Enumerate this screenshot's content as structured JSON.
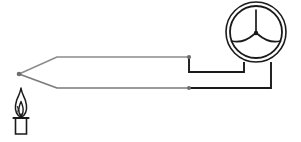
{
  "figure": {
    "type": "schematic-diagram",
    "width": 301,
    "height": 142,
    "background_color": "#ffffff"
  },
  "colors": {
    "wire_stroke": "#8c8c8c",
    "wire_stroke_dark": "#7a7a7a",
    "lead_stroke": "#1a1a1a",
    "meter_stroke": "#1a1a1a",
    "junction_dot": "#6e6e6e",
    "candle_outline": "#1a1a1a",
    "candle_body_fill": "#ffffff",
    "flame_fill": "#ffffff"
  },
  "components": [
    {
      "name": "candle",
      "label": "candle",
      "description": "lit candle providing heat to the hot junction",
      "x": 21,
      "y": 115
    },
    {
      "name": "flame",
      "label": "flame",
      "description": "candle flame heating the thermocouple junction",
      "x": 21,
      "y": 99
    },
    {
      "name": "hot-junction",
      "label": "hot junction",
      "description": "point where the two dissimilar wires are joined",
      "x": 19,
      "y": 74
    },
    {
      "name": "upper-wire",
      "label": "upper conductor",
      "description": "first thermocouple wire from junction to meter terminal"
    },
    {
      "name": "lower-wire",
      "label": "lower conductor",
      "description": "second thermocouple wire from junction to meter terminal"
    },
    {
      "name": "meter",
      "label": "galvanometer",
      "description": "analog needle meter indicating the thermoelectric voltage",
      "x": 256,
      "y": 32
    }
  ],
  "junction_dots": [
    {
      "name": "hot-junction-dot",
      "x": 19,
      "y": 74,
      "r": 2.3
    },
    {
      "name": "upper-wire-corner-dot",
      "x": 189,
      "y": 57,
      "r": 2.1
    },
    {
      "name": "lower-wire-tap-dot",
      "x": 189,
      "y": 88,
      "r": 2.1
    }
  ],
  "geometry": {
    "meter": {
      "center_x": 256,
      "center_y": 32,
      "outer_radius": 30,
      "inner_radius": 26,
      "needle_tip_y": 10,
      "hub_radius": 2.2
    },
    "upper_wire_path": "M 19 74 L 57 57 L 189 57",
    "upper_lead_path": "M 189 57 L 189 72 L 244 72 L 244 62",
    "lower_wire_path": "M 19 74 L 57 88 L 189 88",
    "lower_lead_path": "M 189 88 L 271 88 L 271 62"
  },
  "labels": {
    "visible_text": []
  }
}
